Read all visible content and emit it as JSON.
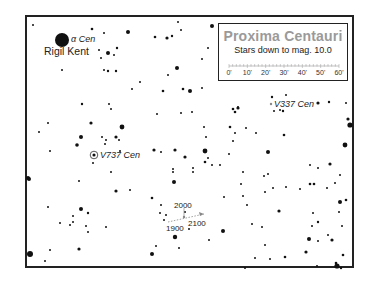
{
  "map": {
    "title": "Proxima Centauri",
    "subtitle": "Stars down to mag. 10.0",
    "scale": {
      "ticks": [
        "0'",
        "10'",
        "20'",
        "30'",
        "40'",
        "50'",
        "60'"
      ],
      "unit": "arcminutes"
    },
    "labels": {
      "alpha_cen": "α Cen",
      "rigil_kent": "Rigil Kent",
      "v737_cen": "V737 Cen",
      "v337_cen": "V337 Cen",
      "year_1900": "1900",
      "year_2000": "2000",
      "year_2100": "2100"
    },
    "colors": {
      "star": "#111111",
      "frame": "#222222",
      "title": "#9a9a9a",
      "motion_arrow": "#888888"
    }
  },
  "stars": [
    {
      "x": 62,
      "y": 40,
      "r": 7
    },
    {
      "x": 33,
      "y": 25,
      "r": 1
    },
    {
      "x": 92,
      "y": 29,
      "r": 1.3
    },
    {
      "x": 104,
      "y": 33,
      "r": 1
    },
    {
      "x": 128,
      "y": 32,
      "r": 2
    },
    {
      "x": 108,
      "y": 53,
      "r": 2
    },
    {
      "x": 117,
      "y": 48,
      "r": 1.2
    },
    {
      "x": 114,
      "y": 55,
      "r": 1
    },
    {
      "x": 99,
      "y": 50,
      "r": 1
    },
    {
      "x": 101,
      "y": 58,
      "r": 1
    },
    {
      "x": 104,
      "y": 70,
      "r": 1
    },
    {
      "x": 108,
      "y": 71,
      "r": 1.2
    },
    {
      "x": 116,
      "y": 71,
      "r": 1.2
    },
    {
      "x": 62,
      "y": 70,
      "r": 1
    },
    {
      "x": 155,
      "y": 37,
      "r": 1.3
    },
    {
      "x": 167,
      "y": 38,
      "r": 1.6
    },
    {
      "x": 172,
      "y": 36,
      "r": 1.2
    },
    {
      "x": 178,
      "y": 22,
      "r": 1
    },
    {
      "x": 181,
      "y": 30,
      "r": 1
    },
    {
      "x": 212,
      "y": 26,
      "r": 2
    },
    {
      "x": 208,
      "y": 48,
      "r": 1
    },
    {
      "x": 202,
      "y": 59,
      "r": 1
    },
    {
      "x": 177,
      "y": 68,
      "r": 2
    },
    {
      "x": 168,
      "y": 75,
      "r": 1
    },
    {
      "x": 140,
      "y": 82,
      "r": 1
    },
    {
      "x": 132,
      "y": 89,
      "r": 1
    },
    {
      "x": 183,
      "y": 89,
      "r": 1.3
    },
    {
      "x": 190,
      "y": 91,
      "r": 2
    },
    {
      "x": 202,
      "y": 88,
      "r": 1
    },
    {
      "x": 48,
      "y": 123,
      "r": 1
    },
    {
      "x": 39,
      "y": 132,
      "r": 1
    },
    {
      "x": 91,
      "y": 123,
      "r": 1.6
    },
    {
      "x": 122,
      "y": 127,
      "r": 2.4
    },
    {
      "x": 109,
      "y": 104,
      "r": 1
    },
    {
      "x": 111,
      "y": 109,
      "r": 1
    },
    {
      "x": 82,
      "y": 104,
      "r": 1.2
    },
    {
      "x": 81,
      "y": 137,
      "r": 2
    },
    {
      "x": 77,
      "y": 145,
      "r": 1.8
    },
    {
      "x": 102,
      "y": 137,
      "r": 1
    },
    {
      "x": 106,
      "y": 140,
      "r": 1
    },
    {
      "x": 105,
      "y": 144,
      "r": 1
    },
    {
      "x": 116,
      "y": 137,
      "r": 1.6
    },
    {
      "x": 119,
      "y": 140,
      "r": 1
    },
    {
      "x": 120,
      "y": 151,
      "r": 1
    },
    {
      "x": 50,
      "y": 151,
      "r": 1
    },
    {
      "x": 93,
      "y": 163,
      "r": 1
    },
    {
      "x": 111,
      "y": 172,
      "r": 1
    },
    {
      "x": 28,
      "y": 178,
      "r": 2
    },
    {
      "x": 163,
      "y": 91,
      "r": 1.3
    },
    {
      "x": 157,
      "y": 114,
      "r": 1
    },
    {
      "x": 181,
      "y": 113,
      "r": 1
    },
    {
      "x": 192,
      "y": 112,
      "r": 1
    },
    {
      "x": 233,
      "y": 109,
      "r": 1.3
    },
    {
      "x": 238,
      "y": 107,
      "r": 1
    },
    {
      "x": 235,
      "y": 112,
      "r": 1.3
    },
    {
      "x": 238,
      "y": 108,
      "r": 1.6
    },
    {
      "x": 204,
      "y": 127,
      "r": 1
    },
    {
      "x": 206,
      "y": 137,
      "r": 1
    },
    {
      "x": 230,
      "y": 127,
      "r": 1.3
    },
    {
      "x": 235,
      "y": 133,
      "r": 1
    },
    {
      "x": 246,
      "y": 128,
      "r": 1
    },
    {
      "x": 256,
      "y": 133,
      "r": 1
    },
    {
      "x": 233,
      "y": 141,
      "r": 1
    },
    {
      "x": 154,
      "y": 150,
      "r": 1.6
    },
    {
      "x": 161,
      "y": 152,
      "r": 1
    },
    {
      "x": 175,
      "y": 150,
      "r": 1.6
    },
    {
      "x": 205,
      "y": 151,
      "r": 2.4
    },
    {
      "x": 185,
      "y": 157,
      "r": 1.6
    },
    {
      "x": 229,
      "y": 154,
      "r": 1
    },
    {
      "x": 208,
      "y": 158,
      "r": 1
    },
    {
      "x": 205,
      "y": 162,
      "r": 1.3
    },
    {
      "x": 212,
      "y": 165,
      "r": 1
    },
    {
      "x": 220,
      "y": 165,
      "r": 1
    },
    {
      "x": 193,
      "y": 168,
      "r": 1
    },
    {
      "x": 173,
      "y": 169,
      "r": 1
    },
    {
      "x": 173,
      "y": 172,
      "r": 1
    },
    {
      "x": 193,
      "y": 172,
      "r": 1
    },
    {
      "x": 243,
      "y": 172,
      "r": 1
    },
    {
      "x": 174,
      "y": 182,
      "r": 2
    },
    {
      "x": 241,
      "y": 184,
      "r": 1
    },
    {
      "x": 268,
      "y": 174,
      "r": 1
    },
    {
      "x": 272,
      "y": 97,
      "r": 1.2
    },
    {
      "x": 280,
      "y": 110,
      "r": 1
    },
    {
      "x": 274,
      "y": 111,
      "r": 1
    },
    {
      "x": 283,
      "y": 111,
      "r": 1.2
    },
    {
      "x": 286,
      "y": 95,
      "r": 1
    },
    {
      "x": 318,
      "y": 103,
      "r": 1.6
    },
    {
      "x": 329,
      "y": 102,
      "r": 1.2
    },
    {
      "x": 346,
      "y": 103,
      "r": 1
    },
    {
      "x": 348,
      "y": 119,
      "r": 1.6
    },
    {
      "x": 350,
      "y": 125,
      "r": 2.6
    },
    {
      "x": 345,
      "y": 145,
      "r": 2.4
    },
    {
      "x": 284,
      "y": 135,
      "r": 1.3
    },
    {
      "x": 268,
      "y": 152,
      "r": 2
    },
    {
      "x": 310,
      "y": 165,
      "r": 1
    },
    {
      "x": 318,
      "y": 168,
      "r": 1
    },
    {
      "x": 330,
      "y": 164,
      "r": 1.6
    },
    {
      "x": 340,
      "y": 175,
      "r": 1
    },
    {
      "x": 264,
      "y": 176,
      "r": 1
    },
    {
      "x": 273,
      "y": 188,
      "r": 1
    },
    {
      "x": 286,
      "y": 187,
      "r": 1
    },
    {
      "x": 300,
      "y": 189,
      "r": 1
    },
    {
      "x": 310,
      "y": 184,
      "r": 1.3
    },
    {
      "x": 314,
      "y": 184,
      "r": 1.3
    },
    {
      "x": 327,
      "y": 188,
      "r": 1
    },
    {
      "x": 335,
      "y": 183,
      "r": 1
    },
    {
      "x": 346,
      "y": 200,
      "r": 1.3
    },
    {
      "x": 340,
      "y": 202,
      "r": 2
    },
    {
      "x": 279,
      "y": 211,
      "r": 1.6
    },
    {
      "x": 313,
      "y": 213,
      "r": 1
    },
    {
      "x": 339,
      "y": 212,
      "r": 1
    },
    {
      "x": 318,
      "y": 222,
      "r": 1.2
    },
    {
      "x": 312,
      "y": 226,
      "r": 1
    },
    {
      "x": 328,
      "y": 235,
      "r": 1
    },
    {
      "x": 342,
      "y": 226,
      "r": 1
    },
    {
      "x": 309,
      "y": 239,
      "r": 2
    },
    {
      "x": 332,
      "y": 240,
      "r": 1.6
    },
    {
      "x": 306,
      "y": 252,
      "r": 1.6
    },
    {
      "x": 343,
      "y": 255,
      "r": 1.3
    },
    {
      "x": 336,
      "y": 263,
      "r": 1.3
    },
    {
      "x": 337,
      "y": 266,
      "r": 2.6
    },
    {
      "x": 341,
      "y": 268,
      "r": 1.2
    },
    {
      "x": 318,
      "y": 241,
      "r": 1
    },
    {
      "x": 265,
      "y": 245,
      "r": 1
    },
    {
      "x": 270,
      "y": 259,
      "r": 1
    },
    {
      "x": 285,
      "y": 257,
      "r": 1.3
    },
    {
      "x": 317,
      "y": 266,
      "r": 1
    },
    {
      "x": 29,
      "y": 179,
      "r": 2
    },
    {
      "x": 79,
      "y": 181,
      "r": 1
    },
    {
      "x": 116,
      "y": 191,
      "r": 1.6
    },
    {
      "x": 130,
      "y": 190,
      "r": 1
    },
    {
      "x": 48,
      "y": 207,
      "r": 1
    },
    {
      "x": 81,
      "y": 209,
      "r": 2
    },
    {
      "x": 88,
      "y": 213,
      "r": 1.2
    },
    {
      "x": 73,
      "y": 216,
      "r": 1
    },
    {
      "x": 60,
      "y": 223,
      "r": 1
    },
    {
      "x": 70,
      "y": 225,
      "r": 1
    },
    {
      "x": 73,
      "y": 222,
      "r": 1
    },
    {
      "x": 86,
      "y": 226,
      "r": 1
    },
    {
      "x": 88,
      "y": 232,
      "r": 1
    },
    {
      "x": 106,
      "y": 227,
      "r": 1
    },
    {
      "x": 30,
      "y": 254,
      "r": 3
    },
    {
      "x": 50,
      "y": 250,
      "r": 1
    },
    {
      "x": 45,
      "y": 261,
      "r": 1
    },
    {
      "x": 79,
      "y": 249,
      "r": 1.6
    },
    {
      "x": 152,
      "y": 254,
      "r": 2
    },
    {
      "x": 152,
      "y": 198,
      "r": 1.3
    },
    {
      "x": 161,
      "y": 205,
      "r": 1
    },
    {
      "x": 160,
      "y": 213,
      "r": 1
    },
    {
      "x": 166,
      "y": 215,
      "r": 1
    },
    {
      "x": 164,
      "y": 220,
      "r": 1
    },
    {
      "x": 185,
      "y": 212,
      "r": 1
    },
    {
      "x": 189,
      "y": 229,
      "r": 1
    },
    {
      "x": 175,
      "y": 237,
      "r": 2.2
    },
    {
      "x": 179,
      "y": 248,
      "r": 1
    },
    {
      "x": 156,
      "y": 246,
      "r": 1
    },
    {
      "x": 209,
      "y": 240,
      "r": 1
    },
    {
      "x": 224,
      "y": 197,
      "r": 1
    },
    {
      "x": 243,
      "y": 196,
      "r": 1
    },
    {
      "x": 247,
      "y": 205,
      "r": 1
    },
    {
      "x": 265,
      "y": 192,
      "r": 1
    },
    {
      "x": 223,
      "y": 231,
      "r": 2
    },
    {
      "x": 252,
      "y": 224,
      "r": 1
    },
    {
      "x": 262,
      "y": 227,
      "r": 1
    },
    {
      "x": 255,
      "y": 258,
      "r": 1
    },
    {
      "x": 245,
      "y": 268,
      "r": 1
    }
  ],
  "special_stars": [
    {
      "name": "v737-cen",
      "x": 94,
      "y": 155,
      "r": 2.6,
      "ring": true
    },
    {
      "name": "v337-cen",
      "x": 271,
      "y": 104,
      "r": 1.2,
      "ring": false
    },
    {
      "name": "proxima-2000",
      "x": 184,
      "y": 217,
      "r": 1.2,
      "ring": false
    }
  ]
}
